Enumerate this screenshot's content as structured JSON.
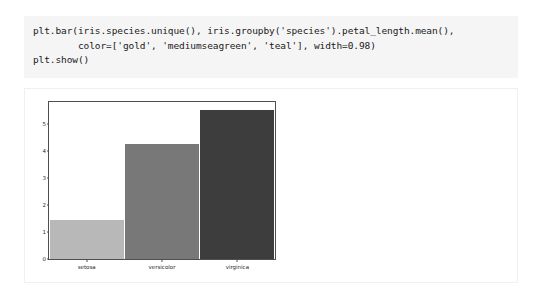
{
  "code_cell": {
    "language": "python",
    "background": "#f5f5f5",
    "source": "plt.bar(iris.species.unique(), iris.groupby('species').petal_length.mean(),\n        color=['gold', 'mediumseagreen', 'teal'], width=0.98)\nplt.show()"
  },
  "output_cell": {
    "background": "#ffffff"
  },
  "chart_data": {
    "type": "bar",
    "title": "",
    "xlabel": "",
    "ylabel": "",
    "categories": [
      "setosa",
      "versicolor",
      "virginica"
    ],
    "values": [
      1.46,
      4.26,
      5.55
    ],
    "bar_colors": [
      "#b8b8b8",
      "#787878",
      "#3d3d3d"
    ],
    "bar_width": 0.98,
    "ylim": [
      0,
      5.83
    ],
    "xlim": [
      -0.5,
      2.5
    ],
    "yticks": [
      0,
      1,
      2,
      3,
      4,
      5
    ],
    "ytick_labels": [
      "0",
      "1",
      "2",
      "3",
      "4",
      "5"
    ],
    "xtick_labels": [
      "setosa",
      "versicolor",
      "virginica"
    ],
    "grid": false,
    "legend": false,
    "frame_color": "#4f4f4f",
    "tick_label_color": "#2b2b2b",
    "figure_background": "#ffffff"
  }
}
